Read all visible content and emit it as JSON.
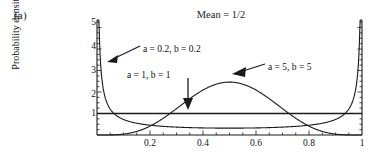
{
  "figure": {
    "panel_label": "(a)",
    "title": "Mean = 1/2",
    "ylabel_prefix": "Probability density ",
    "ylabel_italic": "f(x)"
  },
  "axes": {
    "x_ticks": [
      "0.2",
      "0.4",
      "0.6",
      "0.8",
      "1"
    ],
    "x_tick_values": [
      0.2,
      0.4,
      0.6,
      0.8,
      1.0
    ],
    "y_ticks": [
      "1",
      "2",
      "3",
      "4",
      "5"
    ],
    "y_tick_values": [
      1,
      2,
      3,
      4,
      5
    ],
    "xlim": [
      0,
      1
    ],
    "ylim": [
      0,
      5.35
    ]
  },
  "annotations": [
    {
      "name": "annot-beta-0-2",
      "text": "a = 0.2, b = 0.2",
      "x": 143,
      "y": 44
    },
    {
      "name": "annot-beta-1",
      "text": "a = 1, b = 1",
      "x": 127,
      "y": 70
    },
    {
      "name": "annot-beta-5",
      "text": "a = 5, b = 5",
      "x": 268,
      "y": 62
    }
  ],
  "chart_data": {
    "type": "line",
    "title": "Mean = 1/2",
    "xlabel": "",
    "ylabel": "Probability density f(x)",
    "xlim": [
      0,
      1
    ],
    "ylim": [
      0,
      5.35
    ],
    "grid": false,
    "legend": "annotations-with-arrows",
    "x": [
      0.001,
      0.005,
      0.01,
      0.02,
      0.03,
      0.05,
      0.07,
      0.1,
      0.15,
      0.2,
      0.25,
      0.3,
      0.35,
      0.4,
      0.45,
      0.5,
      0.55,
      0.6,
      0.65,
      0.7,
      0.75,
      0.8,
      0.85,
      0.9,
      0.93,
      0.95,
      0.97,
      0.98,
      0.99,
      0.995,
      0.999
    ],
    "series": [
      {
        "name": "a = 0.2, b = 0.2",
        "params": {
          "a": 0.2,
          "b": 0.2
        },
        "values": [
          5.35,
          3.65,
          2.85,
          2.22,
          1.92,
          1.58,
          1.39,
          1.21,
          1.02,
          0.91,
          0.84,
          0.79,
          0.76,
          0.74,
          0.73,
          0.72,
          0.73,
          0.74,
          0.76,
          0.79,
          0.84,
          0.91,
          1.02,
          1.21,
          1.39,
          1.58,
          1.92,
          2.22,
          2.85,
          3.65,
          5.35
        ]
      },
      {
        "name": "a = 1, b = 1",
        "params": {
          "a": 1,
          "b": 1
        },
        "values": [
          1,
          1,
          1,
          1,
          1,
          1,
          1,
          1,
          1,
          1,
          1,
          1,
          1,
          1,
          1,
          1,
          1,
          1,
          1,
          1,
          1,
          1,
          1,
          1,
          1,
          1,
          1,
          1,
          1,
          1,
          1
        ]
      },
      {
        "name": "a = 5, b = 5",
        "params": {
          "a": 5,
          "b": 5
        },
        "values": [
          0.0,
          0.0,
          0.0,
          0.0,
          0.0,
          0.01,
          0.03,
          0.1,
          0.38,
          0.82,
          1.32,
          1.8,
          2.17,
          2.4,
          2.5,
          2.46,
          2.4,
          2.17,
          1.8,
          1.32,
          0.82,
          0.38,
          0.1,
          0.03,
          0.01,
          0.0,
          0.0,
          0.0,
          0.0,
          0.0,
          0.0
        ]
      }
    ]
  }
}
